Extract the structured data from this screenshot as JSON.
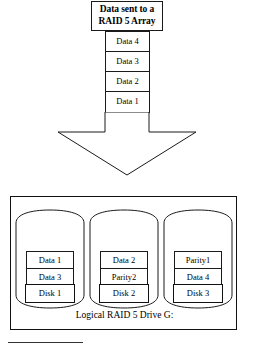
{
  "diagram": {
    "title": {
      "line1": "Data sent to a",
      "line2": "RAID 5 Array"
    },
    "incoming_stack": [
      {
        "label": "Data 4"
      },
      {
        "label": "Data 3"
      },
      {
        "label": "Data 2"
      },
      {
        "label": "Data 1"
      }
    ],
    "arrow": {
      "icon": "down-block-arrow",
      "direction": "down"
    },
    "array": {
      "caption": "Logical RAID 5 Drive G:",
      "disks": [
        {
          "name": "Disk 1",
          "blocks": [
            {
              "label": "Data 1"
            },
            {
              "label": "Data 3"
            }
          ]
        },
        {
          "name": "Disk 2",
          "blocks": [
            {
              "label": "Data 2"
            },
            {
              "label": "Parity2"
            }
          ]
        },
        {
          "name": "Disk 3",
          "blocks": [
            {
              "label": "Parity1"
            },
            {
              "label": "Data 4"
            }
          ]
        }
      ]
    },
    "footnote_rule": {
      "visible": true
    }
  },
  "colors": {
    "line": "#111111",
    "thin_line": "#1a1a1a",
    "background": "#ffffff",
    "text": "#000000"
  }
}
